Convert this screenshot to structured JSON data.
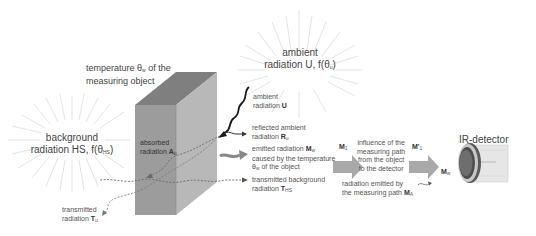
{
  "diagram": {
    "title_object": "temperature θw of the measuring object",
    "object_label_line1": "temperature θ",
    "object_label_sub": "w",
    "object_label_rest": " of the",
    "object_label_line2": "measuring object",
    "ambient_big_line1": "ambient",
    "ambient_big_line2": "radiation U, f(θ",
    "ambient_big_sub": "u",
    "ambient_big_end": ")",
    "background_big_line1": "background",
    "background_big_line2": "radiation HS, f(θ",
    "background_big_sub": "HS",
    "background_big_end": ")",
    "absorbed_line1": "absorbed",
    "absorbed_line2": "radiation ",
    "absorbed_sym": "A",
    "absorbed_sub": "u",
    "ambient_small_line1": "ambient",
    "ambient_small_line2": "radiation ",
    "ambient_small_sym": "U",
    "reflected_line1": "reflected ambient",
    "reflected_line2": "radiation ",
    "reflected_sym": "R",
    "reflected_sub": "u",
    "emitted_line1": "emitted radiation ",
    "emitted_sym": "M",
    "emitted_sub": "w",
    "emitted_line2": "caused by the temperature",
    "emitted_line3_pre": "θ",
    "emitted_line3_sub": "w",
    "emitted_line3_rest": " of the object",
    "transmitted_bg_line1": "transmitted background",
    "transmitted_bg_line2": "radiation ",
    "transmitted_bg_sym": "T",
    "transmitted_bg_sub": "HS",
    "transmitted_line1": "transmitted",
    "transmitted_line2": "radiation ",
    "transmitted_sym": "T",
    "transmitted_sub": "u",
    "m1_sym": "M",
    "m1_sub": "1",
    "influence_line1": "influence of the",
    "influence_line2": "measuring path",
    "influence_line3": "from the object",
    "influence_line4": "to the detector",
    "m1prime_sym": "M'",
    "m1prime_sub": "1",
    "path_emit_line1": "radiation emitted by",
    "path_emit_line2": "the measuring path ",
    "path_emit_sym": "M",
    "path_emit_sub": "A",
    "detector_title": "IR-detector",
    "mw_sym": "M",
    "mw_sub": "w"
  },
  "colors": {
    "box_front": "#9a9a9a",
    "box_top": "#7d7d7d",
    "box_side": "#b4b4b4",
    "arrow": "#a8a8a8",
    "rays": "#d8d8d8",
    "text": "#4a4a4a"
  }
}
